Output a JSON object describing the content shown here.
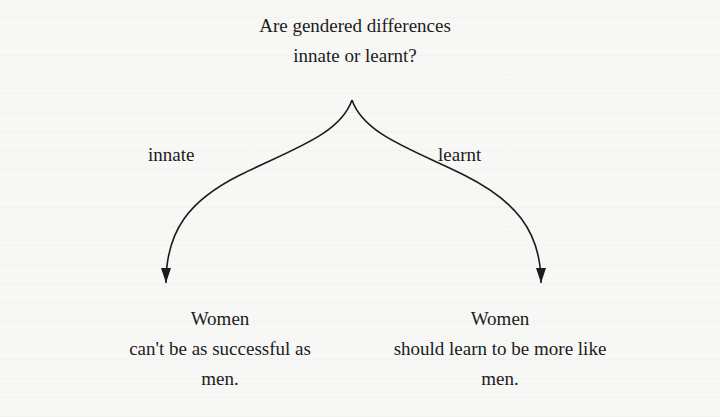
{
  "diagram": {
    "question": {
      "line1": "Are gendered differences",
      "line2": "innate or learnt?"
    },
    "branches": [
      {
        "label": "innate",
        "outcome": {
          "line1": "Women",
          "line2": "can't be as successful as",
          "line3": "men."
        }
      },
      {
        "label": "learnt",
        "outcome": {
          "line1": "Women",
          "line2": "should learn to be more like",
          "line3": "men."
        }
      }
    ],
    "colors": {
      "ink": "#1c1c1c",
      "background": "#f7f7f5"
    }
  }
}
